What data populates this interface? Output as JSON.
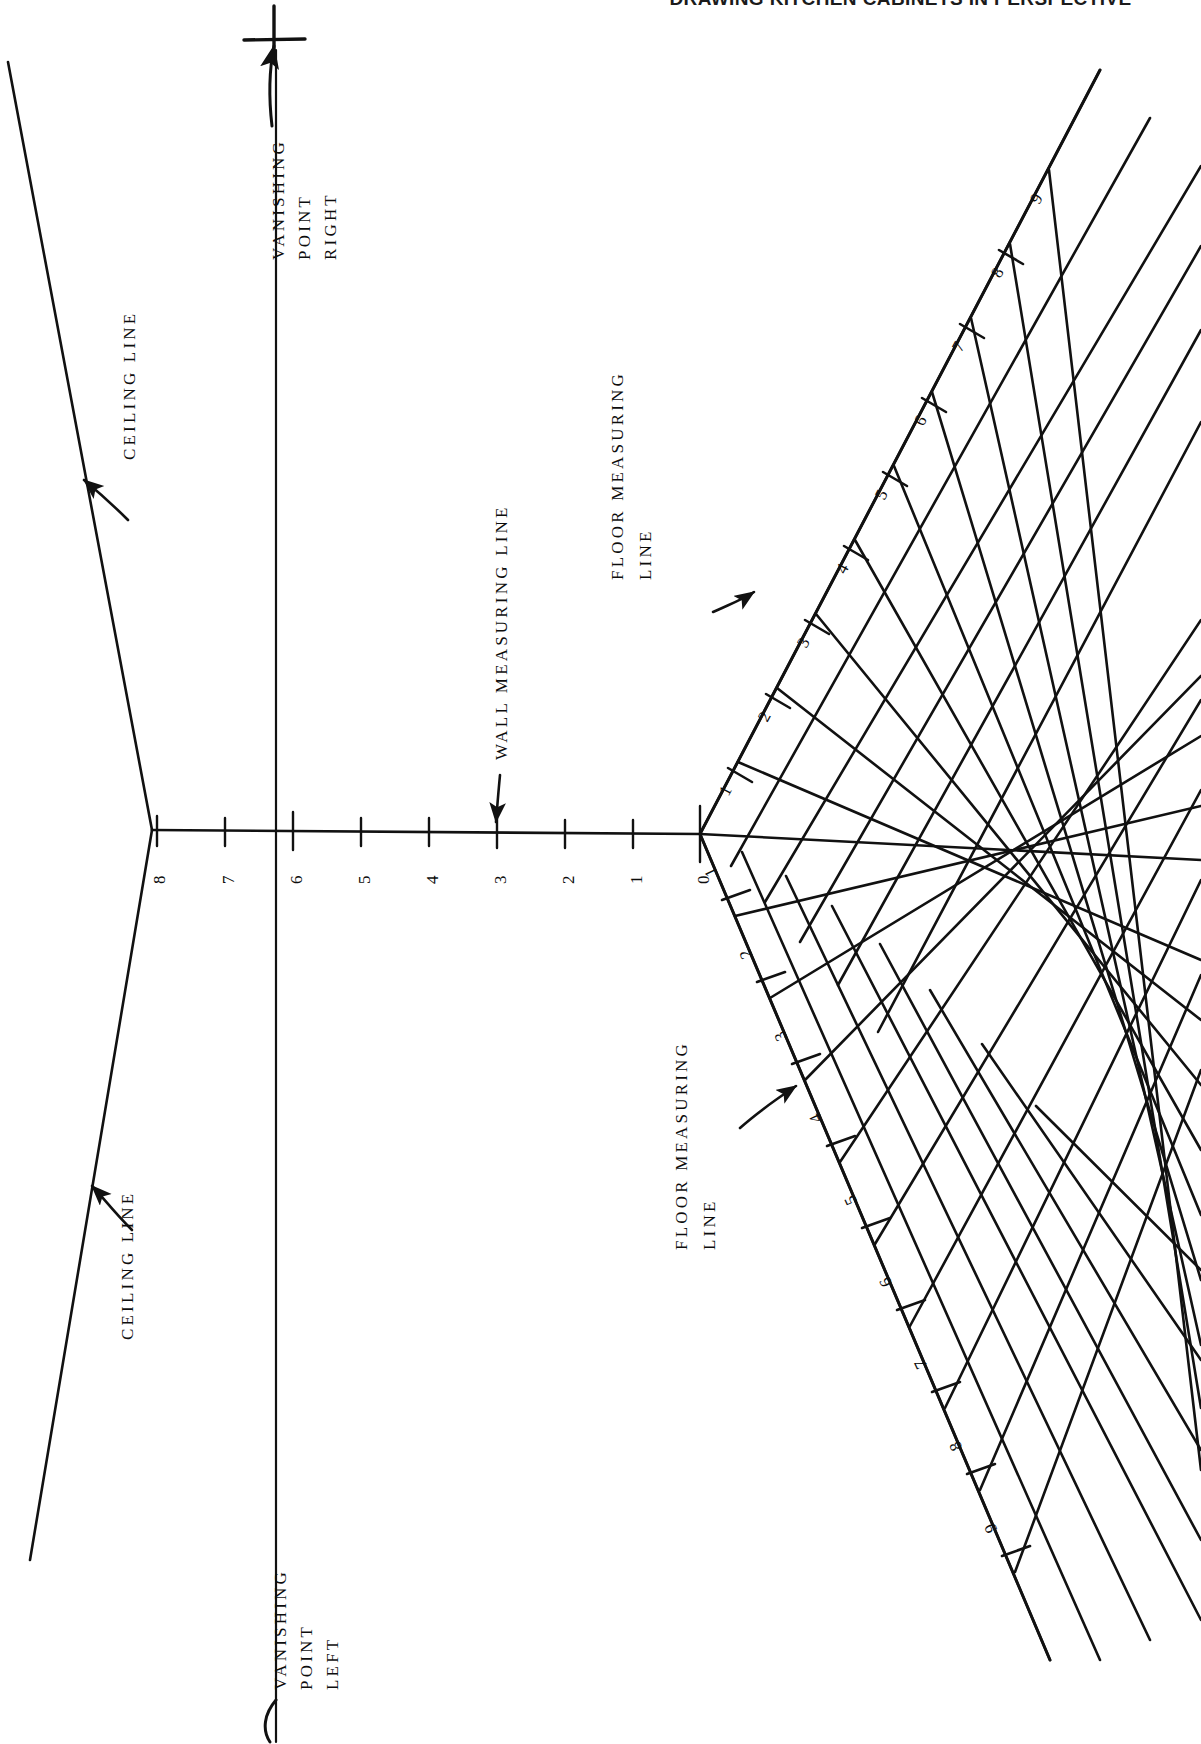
{
  "header": {
    "title": "DRAWING KITCHEN CABINETS IN PERSPECTIVE"
  },
  "diagram": {
    "orientation": "rotated-90-ccw",
    "page_background": "#ffffff",
    "ink_color": "#111111",
    "labels": {
      "vanishing_point_right": [
        "VANISHING",
        "POINT",
        "RIGHT"
      ],
      "vanishing_point_left": [
        "VANISHING",
        "POINT",
        "LEFT"
      ],
      "ceiling_line_top": "CEILING LINE",
      "ceiling_line_bottom": "CEILING LINE",
      "wall_measuring_line": "WALL MEASURING LINE",
      "floor_measuring_line_right": [
        "FLOOR MEASURING",
        "LINE"
      ],
      "floor_measuring_line_left": [
        "FLOOR MEASURING",
        "LINE"
      ]
    },
    "wall_measuring_line": {
      "name": "wall-measuring-line",
      "ticks": [
        "8",
        "7",
        "6",
        "5",
        "4",
        "3",
        "2",
        "1",
        "0"
      ],
      "origin_label": "0",
      "far_label": "8"
    },
    "floor_measuring_line_upper": {
      "name": "floor-measuring-line-upper",
      "ticks": [
        "0",
        "1",
        "2",
        "3",
        "4",
        "5",
        "6",
        "7",
        "8",
        "9"
      ]
    },
    "floor_measuring_line_lower": {
      "name": "floor-measuring-line-lower",
      "ticks": [
        "0",
        "1",
        "2",
        "3",
        "4",
        "5",
        "6",
        "7",
        "8",
        "9"
      ]
    },
    "markers": {
      "vanishing_point_right_symbol": "+",
      "vanishing_point_left_symbol": "("
    }
  }
}
